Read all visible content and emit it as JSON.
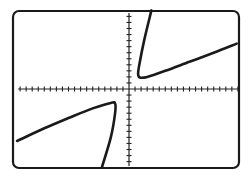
{
  "screen": {
    "title": "Graphing calculator screen",
    "frame_color": "#1a1a1a",
    "curve_color": "#1a1a1a",
    "axis_color": "#222222",
    "background": "#ffffff"
  },
  "chart_data": {
    "type": "line",
    "title": "",
    "xlabel": "",
    "ylabel": "",
    "grid": false,
    "legend": null,
    "axes": {
      "x_ticks_left_of_origin": 18,
      "x_ticks_right_of_origin": 18,
      "y_ticks_above_origin": 13,
      "y_ticks_below_origin": 13,
      "tick_spacing_units": 1
    },
    "xlim": [
      -18.5,
      18
    ],
    "ylim": [
      -13,
      13
    ],
    "series": [
      {
        "name": "upper-branch",
        "points": [
          [
            3.7,
            13
          ],
          [
            2.5,
            8
          ],
          [
            1.7,
            4
          ],
          [
            1.5,
            2.5
          ],
          [
            1.8,
            1.9
          ],
          [
            3,
            2
          ],
          [
            6,
            3
          ],
          [
            10,
            4.5
          ],
          [
            14,
            6
          ],
          [
            17.8,
            7.5
          ]
        ]
      },
      {
        "name": "lower-branch",
        "points": [
          [
            -4.5,
            -13
          ],
          [
            -3,
            -8
          ],
          [
            -2.3,
            -4
          ],
          [
            -2.3,
            -2.4
          ],
          [
            -3,
            -2.3
          ],
          [
            -6,
            -3.2
          ],
          [
            -10,
            -4.8
          ],
          [
            -14,
            -6.5
          ],
          [
            -18.5,
            -8.6
          ]
        ]
      }
    ]
  }
}
